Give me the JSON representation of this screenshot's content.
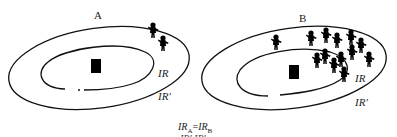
{
  "diagram": {
    "panels": [
      {
        "id": "A",
        "title": "A",
        "inner_region_label": "IR",
        "outer_region_label": "IR'",
        "people_count": 2
      },
      {
        "id": "B",
        "title": "B",
        "inner_region_label": "IR",
        "outer_region_label": "IR'",
        "people_count": 13
      }
    ],
    "caption": {
      "line1_prefix": "IR",
      "line1_sub_a": "A",
      "line1_eq": "=",
      "line1_mid": "IR",
      "line1_sub_b": "B",
      "line2": "IR'  IR'"
    },
    "colors": {
      "stroke": "#111111",
      "fill": "#000000",
      "background": "#ffffff"
    }
  }
}
